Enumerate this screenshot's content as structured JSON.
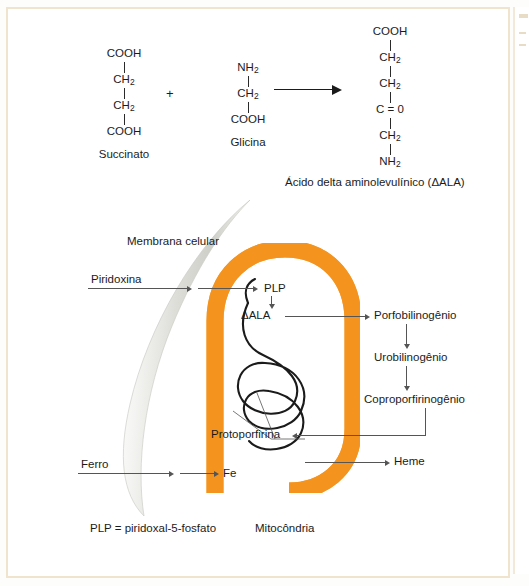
{
  "figure": {
    "reaction": {
      "reactant1": {
        "name": "Succinato",
        "atoms": [
          "COOH",
          "CH2",
          "CH2",
          "COOH"
        ],
        "atoms_display": [
          "COOH",
          "CH₂",
          "CH₂",
          "COOH"
        ]
      },
      "operator": "+",
      "reactant2": {
        "name": "Glicina",
        "atoms": [
          "NH2",
          "CH2",
          "COOH"
        ],
        "atoms_display": [
          "NH₂",
          "CH₂",
          "COOH"
        ]
      },
      "arrow": "reaction-arrow-right",
      "product": {
        "name": "Ácido delta aminolevulínico (ΔALA)",
        "atoms": [
          "COOH",
          "CH2",
          "CH2",
          "C = 0",
          "CH2",
          "NH2"
        ],
        "atoms_display": [
          "COOH",
          "CH₂",
          "CH₂",
          "C = 0",
          "CH₂",
          "NH₂"
        ]
      }
    },
    "diagram": {
      "membrane_label": "Membrana celular",
      "mitochondria_label": "Mitocôndria",
      "legend": "PLP = piridoxal-5-fosfato",
      "inputs": [
        {
          "label": "Piridoxina"
        },
        {
          "label": "Ferro"
        }
      ],
      "inside_nodes": [
        {
          "label": "PLP"
        },
        {
          "label": "ΔALA"
        },
        {
          "label": "Protoporfirina"
        },
        {
          "label": "Fe"
        }
      ],
      "outside_nodes": [
        {
          "label": "Porfobilinogênio"
        },
        {
          "label": "Urobilinogênio"
        },
        {
          "label": "Coproporfirinogênio"
        },
        {
          "label": "Heme"
        }
      ]
    },
    "colors": {
      "mitochondria_orange": "#F4941E",
      "membrane_grey": "#D9D9D4",
      "page_border_cream": "#F0E4CF",
      "text": "#1B1B1B",
      "connector": "#555555"
    }
  }
}
